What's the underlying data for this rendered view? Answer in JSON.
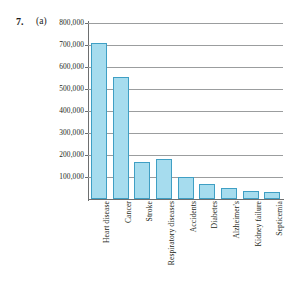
{
  "exercise": {
    "number": "7.",
    "part": "(a)"
  },
  "chart_data": {
    "type": "bar",
    "title": "",
    "subtitle": "",
    "xlabel": "",
    "ylabel": "",
    "grid": true,
    "legend": false,
    "legend_position": "none",
    "ylim": [
      0,
      800000
    ],
    "ytick_labels": [
      "800,000",
      "700,000",
      "600,000",
      "500,000",
      "400,000",
      "300,000",
      "200,000",
      "100,000"
    ],
    "ytick_values": [
      800000,
      700000,
      600000,
      500000,
      400000,
      300000,
      200000,
      100000
    ],
    "categories": [
      "Heart disease",
      "Cancer",
      "Stroke",
      "Respiratory diseases",
      "Accidents",
      "Diabetes",
      "Alzheimer's",
      "Kidney failure",
      "Septicemia"
    ],
    "values": [
      710000,
      553000,
      167000,
      184000,
      98000,
      68000,
      48000,
      36000,
      31000
    ],
    "bar_color": "#a6dcee",
    "bar_edge_color": "#3f9fc4",
    "grid_color": "#9b9d9e",
    "axis_color": "#6d6f70"
  }
}
